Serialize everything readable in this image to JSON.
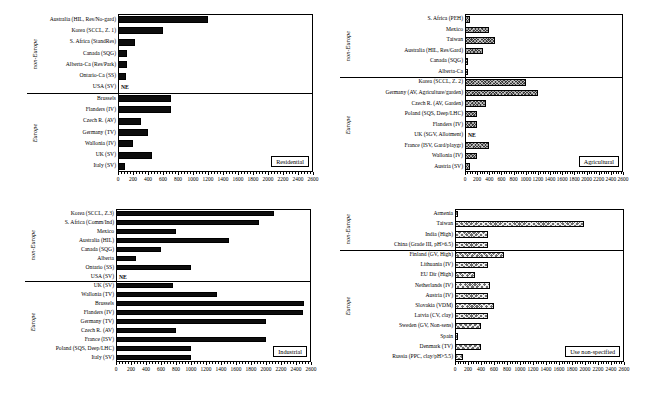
{
  "figure": {
    "axis": {
      "min": 0,
      "max": 2600,
      "major_step": 200,
      "tick_labels": [
        "0",
        "200",
        "400",
        "600",
        "800",
        "1000",
        "1200",
        "1400",
        "1600",
        "1800",
        "2000",
        "2200",
        "2400",
        "2600"
      ]
    },
    "group_labels": {
      "non_europe": "non-Europe",
      "europe": "Europe"
    },
    "not_evaluated_marker": "NE"
  },
  "chart_data": [
    {
      "type": "bar",
      "orientation": "horizontal",
      "title": "Residential",
      "panel": "top-left",
      "xlabel": "",
      "ylabel": "",
      "xlim": [
        0,
        2600
      ],
      "grid": false,
      "fill": "solid-black",
      "groups": [
        {
          "name": "non-Europe",
          "categories": [
            "Australia (HIL, Res/No-gard)",
            "Korea (SCCL, Z. 1)",
            "S. Africa (StandRes)",
            "Canada (SQG)",
            "Alberta-Ca (Res/Park)",
            "Ontario-Ca (SS)",
            "USA (SV)"
          ],
          "values": [
            1200,
            600,
            230,
            120,
            120,
            100,
            null
          ],
          "notes": [
            "",
            "",
            "",
            "",
            "",
            "",
            "NE"
          ]
        },
        {
          "name": "Europe",
          "categories": [
            "Brussels",
            "Flanders (IV)",
            "Czech R. (AV)",
            "Germany (TV)",
            "Wallonia (IV)",
            "UK (SV)",
            "Italy (SV)"
          ],
          "values": [
            700,
            700,
            300,
            400,
            200,
            450,
            90
          ],
          "notes": [
            "",
            "",
            "",
            "",
            "",
            "",
            ""
          ]
        }
      ]
    },
    {
      "type": "bar",
      "orientation": "horizontal",
      "title": "Agricultural",
      "panel": "top-right",
      "xlabel": "",
      "ylabel": "",
      "xlim": [
        0,
        2600
      ],
      "grid": false,
      "fill": "cross-hatch",
      "groups": [
        {
          "name": "non-Europe",
          "categories": [
            "S. Africa (PEH)",
            "Mexico",
            "Taiwan",
            "Australia (HIL, Res/Gard)",
            "Canada (SQG)",
            "Alberta-Ca"
          ],
          "values": [
            80,
            390,
            500,
            300,
            50,
            50
          ],
          "notes": [
            "",
            "",
            "",
            "",
            "",
            ""
          ]
        },
        {
          "name": "Europe",
          "categories": [
            "Korea (SCCL, Z. 2)",
            "Germany (AV, Agriculture/garden)",
            "Czech R. (AV, Garden)",
            "Poland (SQS, Deep/LHC)",
            "Flanders (IV)",
            "UK (SGV, Allotment)",
            "France (ISV, Gard/playgr)",
            "Wallonia (IV)",
            "Austria (SV)"
          ],
          "values": [
            1000,
            1200,
            340,
            200,
            190,
            null,
            400,
            200,
            85
          ],
          "notes": [
            "",
            "",
            "",
            "",
            "",
            "NE",
            "",
            "",
            ""
          ]
        }
      ]
    },
    {
      "type": "bar",
      "orientation": "horizontal",
      "title": "Industrial",
      "panel": "bottom-left",
      "xlabel": "",
      "ylabel": "",
      "xlim": [
        0,
        2600
      ],
      "grid": false,
      "fill": "solid-black",
      "groups": [
        {
          "name": "non-Europe",
          "categories": [
            "Korea (SCCL, Z.3)",
            "S. Africa (Comm/Ind)",
            "Mexico",
            "Australia (HIL)",
            "Canada (SQG)",
            "Alberta",
            "Ontario (SS)",
            "USA (SV)"
          ],
          "values": [
            2100,
            1900,
            800,
            1500,
            600,
            270,
            1000,
            null
          ],
          "notes": [
            "",
            "",
            "",
            "",
            "",
            "",
            "",
            "NE"
          ]
        },
        {
          "name": "Europe",
          "categories": [
            "UK (SV)",
            "Wallonia (TV)",
            "Brussels",
            "Flanders (IV)",
            "Germany (TV)",
            "Czech R. (AV)",
            "France (ISV)",
            "Poland (SQS, Deep/LHC)",
            "Italy (SV)"
          ],
          "values": [
            760,
            1350,
            2500,
            2490,
            2000,
            800,
            2000,
            1000,
            1000
          ],
          "notes": [
            "",
            "",
            "",
            "",
            "",
            "",
            "",
            "",
            ""
          ]
        }
      ]
    },
    {
      "type": "bar",
      "orientation": "horizontal",
      "title": "Use non-specified",
      "panel": "bottom-right",
      "xlabel": "",
      "ylabel": "",
      "xlim": [
        0,
        2600
      ],
      "grid": false,
      "fill": "lattice-hatch",
      "groups": [
        {
          "name": "non-Europe",
          "categories": [
            "Armenia",
            "Taiwan",
            "India (High)",
            "China (Grade III, pH>6.5)"
          ],
          "values": [
            50,
            1990,
            500,
            500
          ],
          "notes": [
            "",
            "",
            "",
            ""
          ]
        },
        {
          "name": "Europe",
          "categories": [
            "Finland (GV, High)",
            "Lithuania (IV)",
            "EU Dir (High)",
            "Netherlands (IV)",
            "Austria (IV)",
            "Slovakia (VDM)",
            "Latvia (CV, clay)",
            "Sweden (GV, Non-sens)",
            "Spain",
            "Denmark (TV)",
            "Russia (PPC, clay/pH>5.5)"
          ],
          "values": [
            750,
            500,
            300,
            540,
            500,
            600,
            500,
            400,
            50,
            400,
            130
          ],
          "notes": [
            "",
            "",
            "",
            "",
            "",
            "",
            "",
            "",
            "",
            "",
            ""
          ]
        }
      ]
    }
  ]
}
